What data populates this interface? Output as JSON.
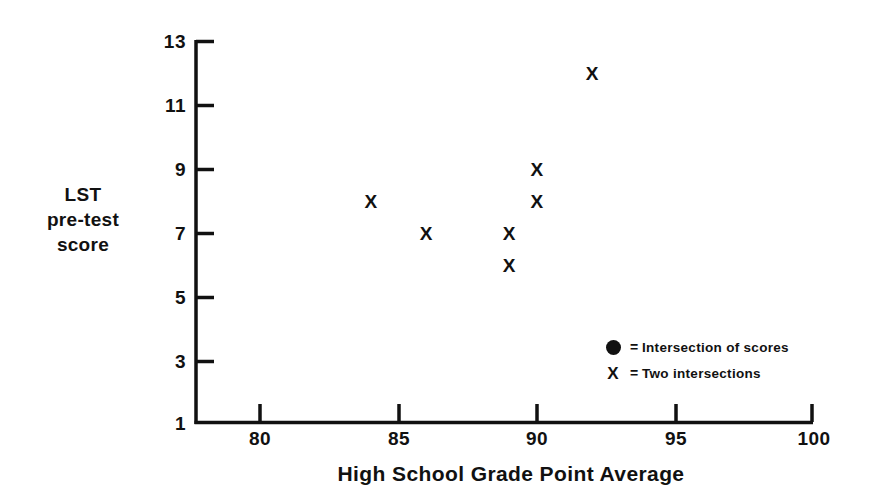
{
  "chart_data": {
    "type": "scatter",
    "title": "",
    "xlabel": "High School Grade Point Average",
    "ylabel": "LST pre-test score",
    "ylabel_lines": [
      "LST",
      "pre-test",
      "score"
    ],
    "xlim": [
      77.5,
      100
    ],
    "ylim": [
      1,
      13
    ],
    "xticks": [
      80,
      85,
      90,
      95,
      100
    ],
    "yticks": [
      1,
      3,
      5,
      7,
      9,
      11,
      13
    ],
    "xtick_labels": [
      "80",
      "85",
      "90",
      "95",
      "100"
    ],
    "ytick_labels": [
      "1",
      "3",
      "5",
      "7",
      "9",
      "11",
      "13"
    ],
    "grid": false,
    "legend_position": "inside-lower-right",
    "series": [
      {
        "name": "Intersection of scores",
        "marker": "filled-circle",
        "points": [
          {
            "x": 81,
            "y": 8
          },
          {
            "x": 81,
            "y": 6
          },
          {
            "x": 81,
            "y": 5
          },
          {
            "x": 83,
            "y": 8
          },
          {
            "x": 84,
            "y": 7
          },
          {
            "x": 87,
            "y": 9
          },
          {
            "x": 87,
            "y": 7
          },
          {
            "x": 87,
            "y": 5
          },
          {
            "x": 90,
            "y": 11
          },
          {
            "x": 90,
            "y": 10
          },
          {
            "x": 92,
            "y": 10
          },
          {
            "x": 92,
            "y": 8
          },
          {
            "x": 93,
            "y": 11
          },
          {
            "x": 94,
            "y": 11
          },
          {
            "x": 94,
            "y": 8
          },
          {
            "x": 96,
            "y": 11
          }
        ]
      },
      {
        "name": "Two intersections",
        "marker": "x",
        "points": [
          {
            "x": 84,
            "y": 8
          },
          {
            "x": 86,
            "y": 7
          },
          {
            "x": 89,
            "y": 7
          },
          {
            "x": 89,
            "y": 6
          },
          {
            "x": 90,
            "y": 9
          },
          {
            "x": 90,
            "y": 8
          },
          {
            "x": 92,
            "y": 12
          }
        ]
      }
    ]
  },
  "legend": {
    "equals": "=",
    "rows": [
      {
        "key": "filled-circle",
        "label": "Intersection of scores"
      },
      {
        "key": "x",
        "label": "Two intersections"
      }
    ]
  },
  "axes": {
    "x_title": "High School Grade Point Average",
    "y_title_line1": "LST",
    "y_title_line2": "pre-test",
    "y_title_line3": "score"
  },
  "colors": {
    "ink": "#111111",
    "background": "#ffffff"
  },
  "marker_glyphs": {
    "x": "X"
  }
}
